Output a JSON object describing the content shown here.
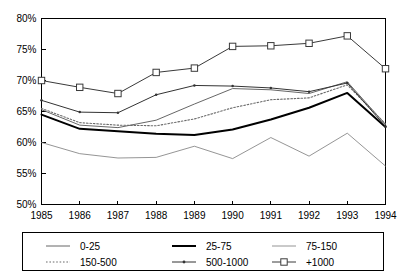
{
  "chart_data": {
    "type": "line",
    "title": "",
    "subtitle": "",
    "xlabel": "",
    "ylabel": "",
    "grid": false,
    "legend_position": "bottom",
    "legend_columns": 3,
    "categories": [
      "1985",
      "1986",
      "1987",
      "1988",
      "1989",
      "1990",
      "1991",
      "1992",
      "1993",
      "1994"
    ],
    "x": [
      1985,
      1986,
      1987,
      1988,
      1989,
      1990,
      1991,
      1992,
      1993,
      1994
    ],
    "xlim": [
      1985,
      1994
    ],
    "ylim": [
      50,
      80
    ],
    "ytick_labels": [
      "50%",
      "55%",
      "60%",
      "65%",
      "70%",
      "75%",
      "80%"
    ],
    "ytick_values": [
      50,
      55,
      60,
      65,
      70,
      75,
      80
    ],
    "xtick_labels": [
      "1985",
      "1986",
      "1987",
      "1988",
      "1989",
      "1990",
      "1991",
      "1992",
      "1993",
      "1994"
    ],
    "value_suffix": "%",
    "series": [
      {
        "name": "0-25",
        "style": "solid-thin",
        "marker": "none",
        "color": "#555555",
        "width": 0.9,
        "values": [
          65.3,
          62.8,
          62.4,
          63.6,
          66.2,
          68.7,
          68.5,
          67.9,
          69.8,
          62.9
        ]
      },
      {
        "name": "25-75",
        "style": "solid-thick",
        "marker": "none",
        "color": "#000000",
        "width": 2.0,
        "values": [
          64.5,
          62.2,
          61.8,
          61.4,
          61.2,
          62.1,
          63.7,
          65.6,
          68.0,
          62.5
        ]
      },
      {
        "name": "75-150",
        "style": "solid-light",
        "marker": "none",
        "color": "#7a7a7a",
        "width": 0.8,
        "values": [
          60.0,
          58.2,
          57.5,
          57.6,
          59.4,
          57.4,
          60.8,
          57.8,
          61.5,
          56.2
        ]
      },
      {
        "name": "150-500",
        "style": "dotted",
        "marker": "none",
        "color": "#6b6b6b",
        "width": 1.1,
        "values": [
          65.5,
          63.2,
          62.8,
          62.7,
          63.8,
          65.6,
          66.9,
          67.2,
          69.3,
          63.0
        ]
      },
      {
        "name": "500-1000",
        "style": "solid-dot",
        "marker": "dot",
        "color": "#333333",
        "width": 1.0,
        "values": [
          66.8,
          64.9,
          64.8,
          67.7,
          69.2,
          69.1,
          68.8,
          68.2,
          69.6,
          62.6
        ]
      },
      {
        "name": "+1000",
        "style": "solid-square",
        "marker": "square",
        "color": "#3a3a3a",
        "width": 1.0,
        "values": [
          70.0,
          68.9,
          67.9,
          71.3,
          72.0,
          75.5,
          75.6,
          76.0,
          77.2,
          71.9
        ]
      }
    ]
  },
  "legend": {
    "items": [
      {
        "label": "0-25",
        "series_index": 0
      },
      {
        "label": "25-75",
        "series_index": 1
      },
      {
        "label": "75-150",
        "series_index": 2
      },
      {
        "label": "150-500",
        "series_index": 3
      },
      {
        "label": "500-1000",
        "series_index": 4
      },
      {
        "label": "+1000",
        "series_index": 5
      }
    ]
  }
}
